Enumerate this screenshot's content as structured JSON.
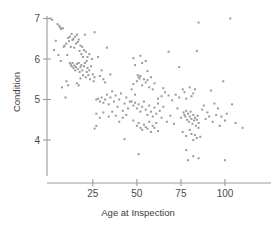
{
  "chart_data": {
    "type": "scatter",
    "title": "",
    "xlabel": "Age at Inspection",
    "ylabel": "Condition",
    "xticks": [
      25,
      50,
      75,
      100
    ],
    "yticks": [
      4,
      5,
      6,
      7
    ],
    "xlim": [
      0,
      118
    ],
    "ylim": [
      3.2,
      7.15
    ],
    "grid": false,
    "legend": null,
    "marker": {
      "shape": "square-dot",
      "size_px": 2,
      "color": "#9a9a9a"
    },
    "n_points": 218,
    "relationship": "negative",
    "points": [
      [
        1,
        7.0
      ],
      [
        2,
        6.97
      ],
      [
        3,
        6.22
      ],
      [
        4,
        6.45
      ],
      [
        5,
        6.86
      ],
      [
        6,
        6.82
      ],
      [
        6.5,
        6.78
      ],
      [
        7,
        6.74
      ],
      [
        8,
        6.76
      ],
      [
        8.5,
        6.3
      ],
      [
        9,
        6.33
      ],
      [
        10,
        6.38
      ],
      [
        10.5,
        6.1
      ],
      [
        11,
        6.52
      ],
      [
        11.5,
        6.44
      ],
      [
        12,
        6.55
      ],
      [
        12.5,
        6.3
      ],
      [
        13,
        6.62
      ],
      [
        13.5,
        6.47
      ],
      [
        14,
        6.5
      ],
      [
        14.5,
        6.28
      ],
      [
        15,
        6.55
      ],
      [
        15.5,
        6.38
      ],
      [
        16,
        6.6
      ],
      [
        16.5,
        6.42
      ],
      [
        17,
        6.48
      ],
      [
        17.5,
        6.2
      ],
      [
        18,
        6.33
      ],
      [
        18.5,
        6.12
      ],
      [
        19,
        6.3
      ],
      [
        19.5,
        6.05
      ],
      [
        20,
        6.22
      ],
      [
        20.5,
        6.6
      ],
      [
        21,
        6.18
      ],
      [
        21.5,
        5.95
      ],
      [
        22,
        6.05
      ],
      [
        5.5,
        6.1
      ],
      [
        6.8,
        5.95
      ],
      [
        7.5,
        5.3
      ],
      [
        9.5,
        5.05
      ],
      [
        12,
        5.9
      ],
      [
        12.5,
        5.86
      ],
      [
        13,
        5.82
      ],
      [
        13.5,
        5.9
      ],
      [
        14,
        5.78
      ],
      [
        14.5,
        5.84
      ],
      [
        15,
        5.72
      ],
      [
        15.5,
        5.8
      ],
      [
        16,
        5.88
      ],
      [
        16.5,
        5.75
      ],
      [
        17,
        5.9
      ],
      [
        17.5,
        5.68
      ],
      [
        18,
        5.8
      ],
      [
        18.5,
        5.85
      ],
      [
        19,
        5.72
      ],
      [
        19.5,
        5.6
      ],
      [
        20,
        5.82
      ],
      [
        20.5,
        5.9
      ],
      [
        21,
        5.55
      ],
      [
        21.5,
        5.68
      ],
      [
        22,
        5.78
      ],
      [
        22.5,
        5.6
      ],
      [
        23,
        5.72
      ],
      [
        23.5,
        5.5
      ],
      [
        24,
        5.82
      ],
      [
        24.5,
        6.0
      ],
      [
        25,
        5.62
      ],
      [
        25.5,
        5.45
      ],
      [
        26,
        5.55
      ],
      [
        10,
        5.45
      ],
      [
        11,
        5.35
      ],
      [
        16,
        5.4
      ],
      [
        17,
        5.35
      ],
      [
        18,
        5.52
      ],
      [
        23,
        6.12
      ],
      [
        26,
        6.66
      ],
      [
        28,
        6.05
      ],
      [
        29,
        5.58
      ],
      [
        30,
        5.72
      ],
      [
        31,
        5.5
      ],
      [
        32,
        5.42
      ],
      [
        33,
        6.28
      ],
      [
        35,
        5.62
      ],
      [
        27,
        5.0
      ],
      [
        28,
        5.02
      ],
      [
        29,
        4.95
      ],
      [
        30,
        5.05
      ],
      [
        31,
        4.92
      ],
      [
        32,
        5.0
      ],
      [
        33,
        5.12
      ],
      [
        34,
        4.88
      ],
      [
        35,
        5.05
      ],
      [
        36,
        5.2
      ],
      [
        37,
        4.95
      ],
      [
        38,
        5.1
      ],
      [
        39,
        4.82
      ],
      [
        40,
        5.0
      ],
      [
        41,
        5.15
      ],
      [
        42,
        4.72
      ],
      [
        43,
        4.9
      ],
      [
        44,
        5.05
      ],
      [
        45,
        4.78
      ],
      [
        46,
        4.95
      ],
      [
        27,
        4.65
      ],
      [
        29,
        4.55
      ],
      [
        31,
        4.68
      ],
      [
        34,
        4.58
      ],
      [
        36,
        4.7
      ],
      [
        38,
        4.6
      ],
      [
        40,
        4.45
      ],
      [
        42,
        4.55
      ],
      [
        44,
        4.62
      ],
      [
        27,
        4.35
      ],
      [
        26,
        4.28
      ],
      [
        43,
        4.02
      ],
      [
        47,
        5.25
      ],
      [
        48,
        5.38
      ],
      [
        49,
        5.12
      ],
      [
        50,
        5.45
      ],
      [
        50.5,
        5.6
      ],
      [
        51,
        5.55
      ],
      [
        51.5,
        5.52
      ],
      [
        52,
        5.58
      ],
      [
        53,
        5.35
      ],
      [
        54,
        5.5
      ],
      [
        55,
        5.42
      ],
      [
        56,
        5.48
      ],
      [
        57,
        5.3
      ],
      [
        58,
        5.55
      ],
      [
        59,
        5.25
      ],
      [
        60,
        5.4
      ],
      [
        48,
        6.02
      ],
      [
        49,
        5.85
      ],
      [
        52,
        6.08
      ],
      [
        53,
        5.9
      ],
      [
        55,
        5.95
      ],
      [
        56,
        5.7
      ],
      [
        47,
        4.95
      ],
      [
        48,
        4.85
      ],
      [
        49,
        4.92
      ],
      [
        50,
        4.78
      ],
      [
        51,
        4.88
      ],
      [
        52,
        4.7
      ],
      [
        53,
        4.82
      ],
      [
        54,
        4.95
      ],
      [
        55,
        4.75
      ],
      [
        56,
        4.62
      ],
      [
        57,
        4.85
      ],
      [
        58,
        4.7
      ],
      [
        59,
        4.58
      ],
      [
        60,
        4.8
      ],
      [
        61,
        4.65
      ],
      [
        62,
        4.9
      ],
      [
        63,
        4.72
      ],
      [
        64,
        4.55
      ],
      [
        65,
        4.82
      ],
      [
        48,
        4.48
      ],
      [
        50,
        4.35
      ],
      [
        51,
        4.42
      ],
      [
        52,
        4.3
      ],
      [
        53,
        4.25
      ],
      [
        54,
        4.38
      ],
      [
        55,
        4.32
      ],
      [
        56,
        4.28
      ],
      [
        57,
        4.45
      ],
      [
        58,
        4.2
      ],
      [
        59,
        4.35
      ],
      [
        60,
        4.3
      ],
      [
        61,
        4.42
      ],
      [
        62,
        4.22
      ],
      [
        51,
        3.65
      ],
      [
        62,
        5.02
      ],
      [
        64,
        5.08
      ],
      [
        65,
        5.28
      ],
      [
        66,
        5.18
      ],
      [
        67,
        4.45
      ],
      [
        68,
        6.18
      ],
      [
        68,
        5.1
      ],
      [
        69,
        4.6
      ],
      [
        70,
        4.98
      ],
      [
        71,
        4.4
      ],
      [
        72,
        5.12
      ],
      [
        73,
        4.78
      ],
      [
        74,
        5.05
      ],
      [
        75,
        4.55
      ],
      [
        76,
        5.25
      ],
      [
        76.5,
        4.68
      ],
      [
        77,
        4.62
      ],
      [
        77.5,
        4.58
      ],
      [
        78,
        4.72
      ],
      [
        78.5,
        4.5
      ],
      [
        79,
        4.65
      ],
      [
        79.5,
        4.45
      ],
      [
        80,
        4.58
      ],
      [
        80.5,
        4.7
      ],
      [
        81,
        4.52
      ],
      [
        81.5,
        4.4
      ],
      [
        82,
        4.62
      ],
      [
        82.5,
        4.48
      ],
      [
        83,
        4.55
      ],
      [
        83.5,
        4.35
      ],
      [
        84,
        4.5
      ],
      [
        84.5,
        4.6
      ],
      [
        85,
        4.42
      ],
      [
        74,
        5.8
      ],
      [
        77,
        5.18
      ],
      [
        78,
        5.02
      ],
      [
        80,
        5.3
      ],
      [
        81,
        5.08
      ],
      [
        82,
        5.15
      ],
      [
        83,
        5.25
      ],
      [
        84,
        6.2
      ],
      [
        85,
        6.9
      ],
      [
        76,
        4.2
      ],
      [
        78,
        4.1
      ],
      [
        80,
        4.25
      ],
      [
        81,
        4.15
      ],
      [
        82,
        4.0
      ],
      [
        83,
        4.12
      ],
      [
        84,
        4.05
      ],
      [
        85,
        4.3
      ],
      [
        86,
        4.08
      ],
      [
        78,
        3.75
      ],
      [
        79,
        3.5
      ],
      [
        82,
        3.6
      ],
      [
        85,
        3.55
      ],
      [
        87,
        4.75
      ],
      [
        88,
        4.85
      ],
      [
        89,
        4.52
      ],
      [
        90,
        4.68
      ],
      [
        91,
        4.58
      ],
      [
        92,
        5.22
      ],
      [
        93,
        4.45
      ],
      [
        94,
        4.9
      ],
      [
        95,
        4.62
      ],
      [
        96,
        4.78
      ],
      [
        97,
        4.35
      ],
      [
        98,
        4.58
      ],
      [
        99,
        5.45
      ],
      [
        100,
        4.48
      ],
      [
        101,
        4.65
      ],
      [
        100,
        3.5
      ],
      [
        103,
        7.0
      ],
      [
        104,
        4.88
      ],
      [
        106,
        4.42
      ],
      [
        110,
        4.3
      ]
    ]
  }
}
